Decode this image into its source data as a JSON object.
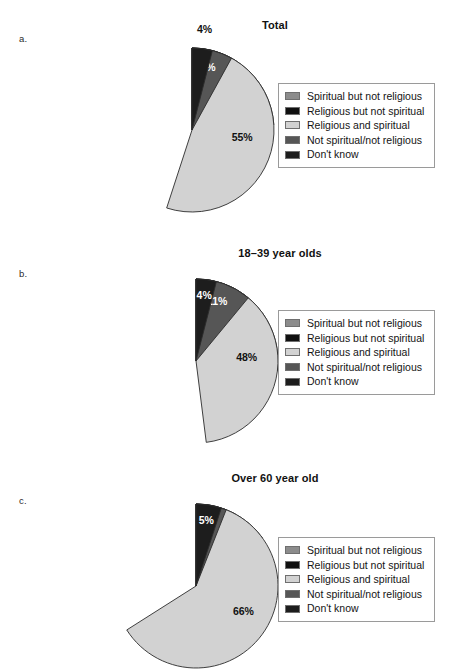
{
  "legend_colors": {
    "spiritual_not_religious": "#8c8c8c",
    "religious_not_spiritual": "#101010",
    "religious_and_spiritual": "#d2d2d2",
    "not_spiritual_not_religious": "#565656",
    "dont_know": "#1d1d1d"
  },
  "legend_labels": [
    "Spiritual but not religious",
    "Religious but not spiritual",
    "Religious and spiritual",
    "Not spiritual/not religious",
    "Don't know"
  ],
  "panels": [
    {
      "letter": "a.",
      "title": "Total",
      "chart_data": {
        "type": "pie",
        "title": "Total",
        "categories": [
          "Spiritual but not religious",
          "Religious but not spiritual",
          "Religious and spiritual",
          "Not spiritual/not religious",
          "Don't know"
        ],
        "values": [
          24,
          9,
          55,
          8,
          4
        ],
        "value_labels": [
          "24%",
          "9%",
          "55%",
          "8%",
          "4%"
        ],
        "colors": [
          "#8c8c8c",
          "#101010",
          "#d2d2d2",
          "#565656",
          "#1d1d1d"
        ],
        "label_colors": [
          "#111111",
          "#ffffff",
          "#111111",
          "#ffffff",
          "#111111"
        ],
        "start_angle_deg": 0,
        "direction": "clockwise",
        "legend_position": "right"
      }
    },
    {
      "letter": "b.",
      "title": "18–39 year olds",
      "chart_data": {
        "type": "pie",
        "title": "18–39 year olds",
        "categories": [
          "Spiritual but not religious",
          "Religious but not spiritual",
          "Religious and spiritual",
          "Not spiritual/not religious",
          "Don't know"
        ],
        "values": [
          27,
          10,
          48,
          11,
          4
        ],
        "value_labels": [
          "27%",
          "10%",
          "48%",
          "11%",
          "4%"
        ],
        "colors": [
          "#8c8c8c",
          "#101010",
          "#d2d2d2",
          "#565656",
          "#1d1d1d"
        ],
        "label_colors": [
          "#111111",
          "#ffffff",
          "#111111",
          "#ffffff",
          "#ffffff"
        ],
        "start_angle_deg": 0,
        "direction": "clockwise",
        "legend_position": "right"
      }
    },
    {
      "letter": "c.",
      "title": "Over 60 year old",
      "chart_data": {
        "type": "pie",
        "title": "Over 60 year old",
        "categories": [
          "Spiritual but not religious",
          "Religious but not spiritual",
          "Religious and spiritual",
          "Not spiritual/not religious",
          "Don't know"
        ],
        "values": [
          15,
          8,
          66,
          6,
          5
        ],
        "value_labels": [
          "15%",
          "8%",
          "66%",
          "6%",
          "5%"
        ],
        "colors": [
          "#8c8c8c",
          "#101010",
          "#d2d2d2",
          "#565656",
          "#1d1d1d"
        ],
        "label_colors": [
          "#111111",
          "#ffffff",
          "#111111",
          "#ffffff",
          "#ffffff"
        ],
        "start_angle_deg": 0,
        "direction": "clockwise",
        "legend_position": "right"
      }
    }
  ]
}
